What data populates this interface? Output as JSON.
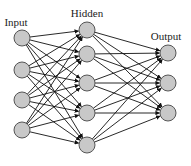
{
  "diagram": {
    "type": "neural-network",
    "layers": [
      {
        "name": "Input",
        "label": "Input",
        "label_pos": [
          16,
          26
        ],
        "x": 22,
        "nodes_y": [
          38,
          70,
          100,
          130
        ]
      },
      {
        "name": "Hidden",
        "label": "Hidden",
        "label_pos": [
          87,
          17
        ],
        "x": 87,
        "nodes_y": [
          30,
          54,
          83,
          113,
          145
        ]
      },
      {
        "name": "Output",
        "label": "Output",
        "label_pos": [
          166,
          40
        ],
        "x": 168,
        "nodes_y": [
          53,
          83,
          113
        ]
      }
    ],
    "connections": "fully-connected, with arrowheads pointing into the next layer",
    "node_radius": 8,
    "colors": {
      "node_fill": "#c8c8c8",
      "node_stroke": "#555555",
      "edge": "#111111",
      "text": "#222222",
      "background": "#ffffff"
    }
  }
}
